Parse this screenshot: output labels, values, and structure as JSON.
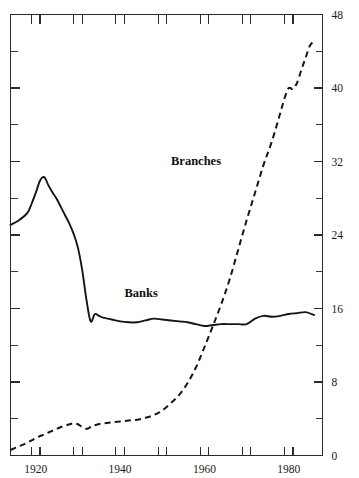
{
  "chart_data": {
    "type": "line",
    "title": "",
    "subtitle": "",
    "xlabel": "",
    "ylabel": "",
    "xlim": [
      1914,
      1988
    ],
    "ylim": [
      0,
      48
    ],
    "grid": false,
    "legend_position": "inline-annotations",
    "y_axis": {
      "side": "right",
      "major_ticks": [
        0,
        8,
        16,
        24,
        32,
        40,
        48
      ],
      "major_tick_labels": [
        "0",
        "8",
        "16",
        "24",
        "32",
        "40",
        "48"
      ],
      "minor_ticks": [
        4,
        12,
        20,
        28,
        36,
        44
      ],
      "tick_step": 4
    },
    "x_axis": {
      "major_ticks": [
        1920,
        1940,
        1960,
        1980
      ],
      "major_tick_labels": [
        "1920",
        "1940",
        "1960",
        "1980"
      ],
      "tick_pair_years": [
        1920,
        1930,
        1940,
        1950,
        1960,
        1970,
        1980,
        1990
      ],
      "tick_pair_offset_years": 2,
      "end_tick_year": 1988
    },
    "annotations": [
      {
        "text": "Branches",
        "x": 1958,
        "y": 31.6
      },
      {
        "text": "Banks",
        "x": 1945,
        "y": 17.3
      }
    ],
    "series": [
      {
        "name": "Banks",
        "style": "solid",
        "color": "#151515",
        "x": [
          1914,
          1916,
          1918,
          1919,
          1920,
          1921,
          1922,
          1923,
          1924,
          1925,
          1926,
          1927,
          1928,
          1929,
          1930,
          1931,
          1932,
          1933,
          1934,
          1935,
          1936,
          1938,
          1940,
          1942,
          1944,
          1946,
          1948,
          1950,
          1952,
          1954,
          1956,
          1958,
          1960,
          1962,
          1964,
          1966,
          1968,
          1970,
          1972,
          1974,
          1976,
          1978,
          1980,
          1982,
          1984,
          1986
        ],
        "values": [
          25.1,
          25.6,
          26.4,
          27.4,
          28.6,
          29.9,
          30.3,
          29.4,
          28.6,
          27.9,
          27.0,
          26.1,
          25.2,
          24.1,
          22.6,
          20.2,
          17.0,
          14.6,
          15.4,
          15.2,
          15.0,
          14.8,
          14.6,
          14.5,
          14.5,
          14.7,
          14.9,
          14.8,
          14.7,
          14.6,
          14.5,
          14.3,
          14.1,
          14.2,
          14.3,
          14.3,
          14.3,
          14.3,
          14.9,
          15.2,
          15.1,
          15.2,
          15.4,
          15.5,
          15.6,
          15.3
        ]
      },
      {
        "name": "Branches",
        "style": "dashed",
        "color": "#151515",
        "x": [
          1914,
          1916,
          1918,
          1920,
          1922,
          1924,
          1926,
          1928,
          1929,
          1930,
          1931,
          1932,
          1933,
          1934,
          1936,
          1938,
          1940,
          1942,
          1944,
          1946,
          1948,
          1950,
          1952,
          1954,
          1956,
          1958,
          1960,
          1962,
          1964,
          1966,
          1968,
          1970,
          1972,
          1974,
          1976,
          1978,
          1979,
          1980,
          1981,
          1982,
          1983,
          1984,
          1985,
          1986
        ],
        "values": [
          0.6,
          1.0,
          1.4,
          1.9,
          2.3,
          2.7,
          3.1,
          3.4,
          3.5,
          3.4,
          3.1,
          2.9,
          3.1,
          3.3,
          3.5,
          3.6,
          3.7,
          3.8,
          3.9,
          4.1,
          4.4,
          4.9,
          5.7,
          6.6,
          7.9,
          9.6,
          11.8,
          14.1,
          16.5,
          19.2,
          22.4,
          25.6,
          28.6,
          31.6,
          34.2,
          37.3,
          38.9,
          40.0,
          39.9,
          40.6,
          42.0,
          43.3,
          44.6,
          45.1
        ]
      }
    ]
  }
}
